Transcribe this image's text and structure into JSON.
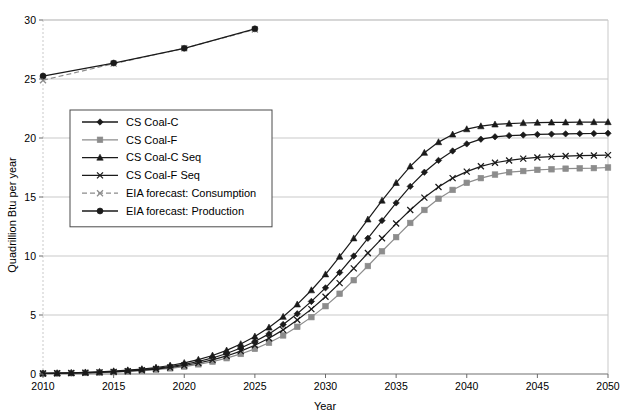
{
  "chart_data": {
    "type": "line",
    "title": "",
    "xlabel": "Year",
    "ylabel": "Quadrillion Btu per year",
    "xlim": [
      2010,
      2050
    ],
    "ylim": [
      0,
      30
    ],
    "xticks": [
      2010,
      2015,
      2020,
      2025,
      2030,
      2035,
      2040,
      2045,
      2050
    ],
    "yticks": [
      0,
      5,
      10,
      15,
      20,
      25,
      30
    ],
    "grid": true,
    "legend_position": "upper-left-inside",
    "x": [
      2010,
      2011,
      2012,
      2013,
      2014,
      2015,
      2016,
      2017,
      2018,
      2019,
      2020,
      2021,
      2022,
      2023,
      2024,
      2025,
      2026,
      2027,
      2028,
      2029,
      2030,
      2031,
      2032,
      2033,
      2034,
      2035,
      2036,
      2037,
      2038,
      2039,
      2040,
      2041,
      2042,
      2043,
      2044,
      2045,
      2046,
      2047,
      2048,
      2049,
      2050
    ],
    "series": [
      {
        "name": "CS Coal-C",
        "marker": "diamond",
        "line": "solid",
        "color": "#1a1a1a",
        "values": [
          0.05,
          0.07,
          0.09,
          0.12,
          0.16,
          0.21,
          0.28,
          0.37,
          0.48,
          0.63,
          0.82,
          1.06,
          1.36,
          1.74,
          2.2,
          2.75,
          3.4,
          4.2,
          5.1,
          6.15,
          7.3,
          8.6,
          10.0,
          11.5,
          13.0,
          14.5,
          15.9,
          17.1,
          18.1,
          18.9,
          19.5,
          19.9,
          20.1,
          20.2,
          20.25,
          20.3,
          20.33,
          20.35,
          20.37,
          20.38,
          20.4
        ]
      },
      {
        "name": "CS Coal-F",
        "marker": "square",
        "line": "solid",
        "color": "#8c8c8c",
        "values": [
          0.04,
          0.05,
          0.07,
          0.09,
          0.12,
          0.16,
          0.21,
          0.28,
          0.37,
          0.48,
          0.63,
          0.82,
          1.05,
          1.34,
          1.7,
          2.13,
          2.65,
          3.27,
          4.0,
          4.82,
          5.75,
          6.8,
          7.95,
          9.15,
          10.4,
          11.6,
          12.8,
          13.9,
          14.85,
          15.6,
          16.2,
          16.6,
          16.9,
          17.1,
          17.2,
          17.3,
          17.35,
          17.4,
          17.43,
          17.45,
          17.5
        ]
      },
      {
        "name": "CS Coal-C Seq",
        "marker": "triangle",
        "line": "solid",
        "color": "#1a1a1a",
        "values": [
          0.06,
          0.08,
          0.1,
          0.14,
          0.18,
          0.24,
          0.32,
          0.42,
          0.55,
          0.72,
          0.94,
          1.22,
          1.57,
          2.0,
          2.54,
          3.18,
          3.94,
          4.85,
          5.9,
          7.1,
          8.45,
          9.95,
          11.5,
          13.1,
          14.7,
          16.2,
          17.6,
          18.75,
          19.65,
          20.3,
          20.75,
          21.0,
          21.15,
          21.22,
          21.27,
          21.3,
          21.32,
          21.33,
          21.34,
          21.35,
          21.35
        ]
      },
      {
        "name": "CS Coal-F Seq",
        "marker": "x",
        "line": "solid",
        "color": "#1a1a1a",
        "values": [
          0.045,
          0.06,
          0.08,
          0.1,
          0.14,
          0.18,
          0.24,
          0.32,
          0.42,
          0.55,
          0.72,
          0.93,
          1.2,
          1.53,
          1.94,
          2.44,
          3.03,
          3.74,
          4.57,
          5.5,
          6.55,
          7.7,
          8.95,
          10.25,
          11.5,
          12.75,
          13.9,
          14.95,
          15.85,
          16.6,
          17.15,
          17.6,
          17.9,
          18.1,
          18.25,
          18.35,
          18.42,
          18.47,
          18.5,
          18.52,
          18.55
        ]
      },
      {
        "name": "EIA forecast: Consumption",
        "marker": "x",
        "line": "dashed",
        "color": "#8c8c8c",
        "x": [
          2010,
          2015,
          2020,
          2025
        ],
        "values": [
          24.9,
          26.3,
          27.6,
          29.2
        ]
      },
      {
        "name": "EIA forecast: Production",
        "marker": "circle",
        "line": "solid",
        "color": "#1a1a1a",
        "x": [
          2010,
          2015,
          2020,
          2025
        ],
        "values": [
          25.25,
          26.35,
          27.6,
          29.25
        ]
      }
    ]
  },
  "axes": {
    "xlabel": "Year",
    "ylabel": "Quadrillion Btu per year",
    "xticks": [
      "2010",
      "2015",
      "2020",
      "2025",
      "2030",
      "2035",
      "2040",
      "2045",
      "2050"
    ],
    "yticks": [
      "0",
      "5",
      "10",
      "15",
      "20",
      "25",
      "30"
    ]
  },
  "legend": {
    "items": [
      {
        "label": "CS Coal-C"
      },
      {
        "label": "CS Coal-F"
      },
      {
        "label": "CS Coal-C Seq"
      },
      {
        "label": "CS Coal-F Seq"
      },
      {
        "label": "EIA forecast: Consumption"
      },
      {
        "label": "EIA forecast: Production"
      }
    ]
  }
}
